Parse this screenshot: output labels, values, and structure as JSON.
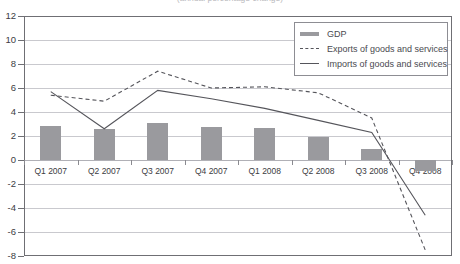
{
  "title_clipped": "(annual percentage change)",
  "legend": {
    "items": [
      {
        "label": "GDP",
        "style": "bar",
        "color": "#9a9a9e"
      },
      {
        "label": "Exports of goods and services",
        "style": "dashed",
        "color": "#55555b"
      },
      {
        "label": "Imports of goods and services",
        "style": "solid",
        "color": "#55555b"
      }
    ]
  },
  "axis": {
    "y_ticks": [
      "12",
      "10",
      "8",
      "6",
      "4",
      "2",
      "0",
      "-2",
      "-4",
      "-6",
      "-8"
    ],
    "x_labels": [
      "Q1 2007",
      "Q2 2007",
      "Q3 2007",
      "Q4 2007",
      "Q1 2008",
      "Q2 2008",
      "Q3 2008",
      "Q4 2008"
    ]
  },
  "chart_data": {
    "type": "bar",
    "title": "(annual percentage change)",
    "xlabel": "",
    "ylabel": "",
    "ylim": [
      -8,
      12
    ],
    "ytick_step": 2,
    "grid": true,
    "legend_position": "top-right",
    "categories": [
      "Q1 2007",
      "Q2 2007",
      "Q3 2007",
      "Q4 2007",
      "Q1 2008",
      "Q2 2008",
      "Q3 2008",
      "Q4 2008"
    ],
    "series": [
      {
        "name": "GDP",
        "type": "bar",
        "color": "#9a9a9e",
        "values": [
          2.8,
          2.6,
          3.1,
          2.75,
          2.7,
          1.9,
          0.9,
          -0.9
        ]
      },
      {
        "name": "Exports of goods and services",
        "type": "line",
        "style": "dashed",
        "color": "#55555b",
        "values": [
          5.4,
          4.9,
          7.4,
          6.0,
          6.1,
          5.6,
          3.5,
          -7.5
        ]
      },
      {
        "name": "Imports of goods and services",
        "type": "line",
        "style": "solid",
        "color": "#55555b",
        "values": [
          5.7,
          2.6,
          5.8,
          5.1,
          4.3,
          3.3,
          2.3,
          -4.6
        ]
      }
    ]
  }
}
